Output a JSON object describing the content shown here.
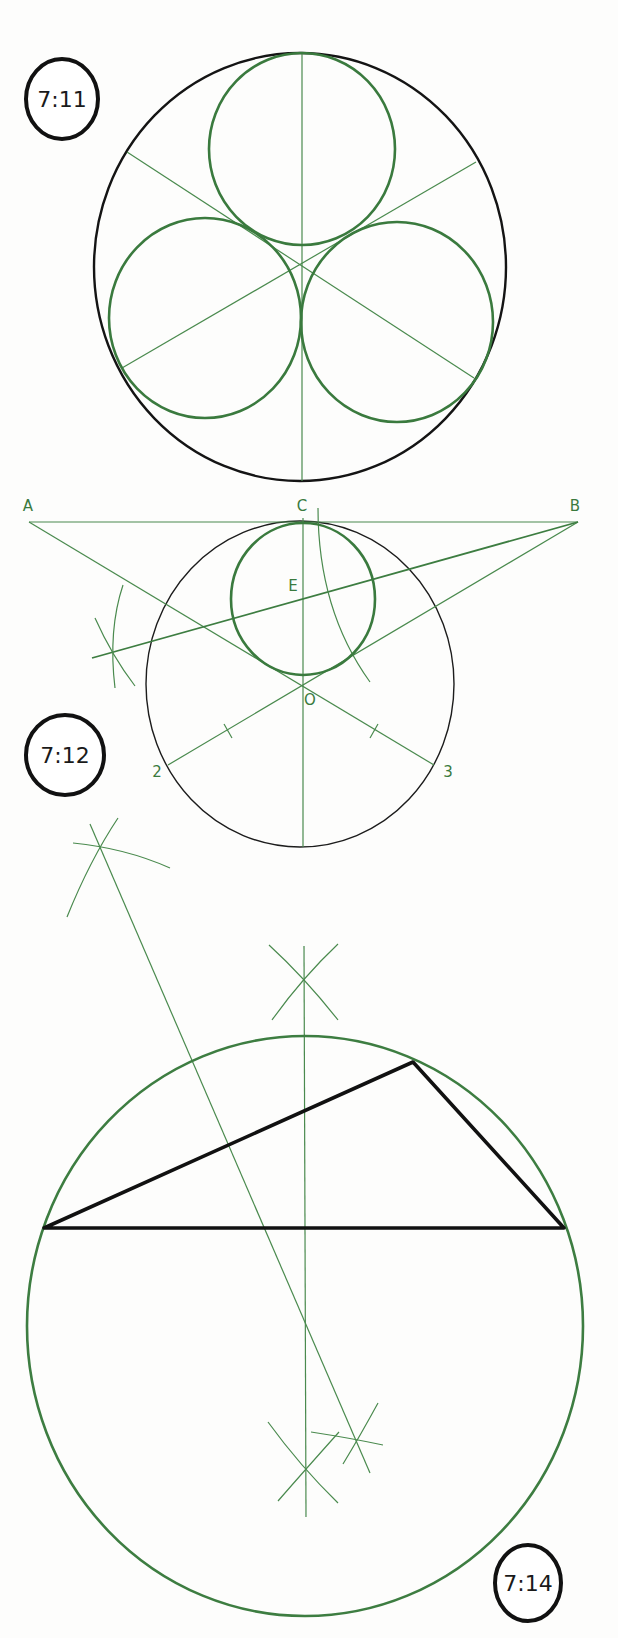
{
  "page": {
    "background": "#fdfdfc",
    "colors": {
      "construction_green": "#3d7d41",
      "outline_black": "#111111"
    }
  },
  "figures": [
    {
      "id": "7:11",
      "label": "7:11",
      "description": "Three equal circles inscribed in a circle, tangent to each other and to the outer circle",
      "outer_circle": {
        "cx": 300,
        "cy": 267,
        "rx": 206,
        "ry": 214,
        "color": "black"
      },
      "inner_circles": [
        {
          "cx": 302,
          "cy": 149,
          "r": 94
        },
        {
          "cx": 205,
          "cy": 318,
          "r": 97
        },
        {
          "cx": 397,
          "cy": 322,
          "r": 97
        }
      ],
      "center": {
        "x": 302,
        "y": 263
      },
      "spokes": [
        {
          "x1": 302,
          "y1": 53,
          "x2": 302,
          "y2": 481
        },
        {
          "x1": 127,
          "y1": 152,
          "x2": 474,
          "y2": 378
        },
        {
          "x1": 476,
          "y1": 162,
          "x2": 122,
          "y2": 368
        }
      ]
    },
    {
      "id": "7:12",
      "label": "7:12",
      "description": "Circle inscribed in triangle ABC tangent construction with center O and points 2, 3",
      "points": {
        "A": {
          "label": "A",
          "x": 29,
          "y": 522
        },
        "B": {
          "label": "B",
          "x": 578,
          "y": 522
        },
        "C": {
          "label": "C",
          "x": 303,
          "y": 522
        },
        "E": {
          "label": "E",
          "x": 303,
          "y": 596
        },
        "O": {
          "label": "O",
          "x": 303,
          "y": 684
        },
        "P2": {
          "label": "2",
          "x": 168,
          "y": 765
        },
        "P3": {
          "label": "3",
          "x": 434,
          "y": 765
        }
      },
      "outer_circle": {
        "cx": 300,
        "cy": 684,
        "rx": 154,
        "ry": 163
      },
      "inner_circle": {
        "cx": 303,
        "cy": 599,
        "rx": 72,
        "ry": 76
      }
    },
    {
      "id": "7:14",
      "label": "7:14",
      "description": "Circumscribed circle of a triangle found by perpendicular bisectors",
      "triangle": [
        {
          "x": 44,
          "y": 1228
        },
        {
          "x": 413,
          "y": 1062
        },
        {
          "x": 564,
          "y": 1228
        }
      ],
      "circumcircle": {
        "cx": 305,
        "cy": 1326,
        "rx": 278,
        "ry": 290
      },
      "circumcenter": {
        "x": 306,
        "y": 1320
      }
    }
  ]
}
